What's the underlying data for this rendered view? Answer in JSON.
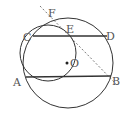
{
  "diagram": {
    "type": "geometry",
    "colors": {
      "stroke": "#333333",
      "label": "#555555",
      "background": "#ffffff"
    },
    "circles": [
      {
        "name": "circle-O",
        "cx": 68,
        "cy": 63,
        "r": 45
      },
      {
        "name": "circle-small",
        "cx": 48,
        "cy": 53,
        "r": 28
      }
    ],
    "points": {
      "A": {
        "label": "A",
        "x": 26,
        "y": 77,
        "lx": 13,
        "ly": 86
      },
      "B": {
        "label": "B",
        "x": 111,
        "y": 76,
        "lx": 112,
        "ly": 85
      },
      "C": {
        "label": "C",
        "x": 33,
        "y": 36,
        "lx": 23,
        "ly": 41
      },
      "D": {
        "label": "D",
        "x": 107,
        "y": 36,
        "lx": 106,
        "ly": 40
      },
      "E": {
        "label": "E",
        "x": 69,
        "y": 36,
        "lx": 66,
        "ly": 33
      },
      "F": {
        "label": "F",
        "x": 52,
        "y": 19,
        "lx": 48,
        "ly": 17
      },
      "O": {
        "label": "O",
        "x": 67,
        "y": 63,
        "lx": 70,
        "ly": 67
      }
    },
    "segments": [
      {
        "name": "CD",
        "from": "C",
        "to": "D"
      },
      {
        "name": "AB",
        "from": "A",
        "to": "B"
      }
    ],
    "dashed_line": {
      "name": "FB",
      "x1": 40,
      "y1": 6,
      "x2": 118,
      "y2": 86
    }
  }
}
